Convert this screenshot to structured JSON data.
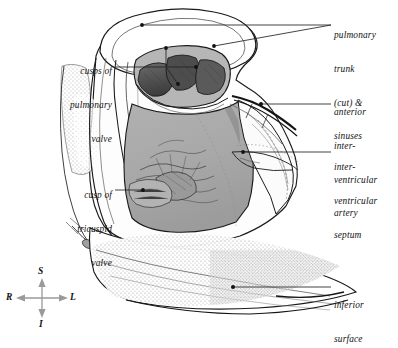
{
  "figure": {
    "background": "#ffffff",
    "width": 398,
    "height": 334
  },
  "labels": {
    "left": [
      {
        "name": "cusps-of-pulmonary-valve",
        "lines": [
          "cusps of",
          "pulmonary",
          "valve"
        ],
        "x": 12,
        "y": 44,
        "w": 100,
        "align": "right",
        "leader": {
          "x1": 115,
          "y1": 67,
          "x2": 196,
          "y2": 67,
          "dot": true
        }
      },
      {
        "name": "cusp-of-tricuspid-valve",
        "lines": [
          "cusp of",
          "tricuspid",
          "valve"
        ],
        "x": 12,
        "y": 168,
        "w": 100,
        "align": "right",
        "leader": {
          "x1": 115,
          "y1": 190,
          "x2": 143,
          "y2": 190,
          "dot": true
        }
      }
    ],
    "right": [
      {
        "name": "pulmonary-trunk-cut-and-sinuses",
        "lines": [
          "pulmonary",
          "trunk",
          "(cut) &",
          "sinuses"
        ],
        "x": 334,
        "y": 8,
        "w": 62,
        "align": "left",
        "leader": {
          "x1": 331,
          "y1": 25,
          "x2": 142,
          "y2": 25,
          "dot": true
        }
      },
      {
        "name": "anterior-interventricular-artery",
        "lines": [
          "anterior",
          "inter-",
          "ventricular",
          "artery"
        ],
        "x": 334,
        "y": 85,
        "w": 62,
        "align": "left",
        "leader": {
          "x1": 331,
          "y1": 104,
          "x2": 261,
          "y2": 104,
          "dot": true
        }
      },
      {
        "name": "interventricular-septum",
        "lines": [
          "inter-",
          "ventricular",
          "septum"
        ],
        "x": 334,
        "y": 140,
        "w": 62,
        "align": "left",
        "leader": {
          "x1": 331,
          "y1": 152,
          "x2": 243,
          "y2": 152,
          "dot": true
        }
      },
      {
        "name": "inferior-surface",
        "lines": [
          "inferior",
          "surface"
        ],
        "x": 334,
        "y": 278,
        "w": 62,
        "align": "left",
        "leader": {
          "x1": 331,
          "y1": 287,
          "x2": 233,
          "y2": 287,
          "dot": true
        }
      }
    ]
  },
  "compass": {
    "name": "orientation-compass",
    "center_x": 42,
    "center_y": 298,
    "arm": 22,
    "color": "#9a9a9a",
    "labels": {
      "superior": "S",
      "inferior": "I",
      "right": "R",
      "left": "L"
    },
    "positions": {
      "superior": {
        "x": 38,
        "y": 268
      },
      "inferior": {
        "x": 39,
        "y": 321
      },
      "right": {
        "x": 8,
        "y": 295
      },
      "left": {
        "x": 68,
        "y": 295
      }
    }
  },
  "colors": {
    "ink": "#1a1a1a",
    "chamber_gray": "#a9a9a9",
    "chamber_dark": "#6f6f6f",
    "cusp_dark": "#4a4a4a",
    "stipple": "#b9b9b9",
    "pale": "#f4f4f4",
    "leader": "#222222",
    "compass": "#9a9a9a"
  },
  "artwork": {
    "name": "heart-right-ventricle-illustration",
    "description": "Pen-and-ink anatomical drawing: the anterior wall of the right ventricle is reflected open, exposing the interventricular septum, the cusp of the tricuspid valve, trabeculae carneae, and the cut pulmonary trunk with its valve cusps and sinuses at the top. A stippled inferior surface lies below."
  }
}
